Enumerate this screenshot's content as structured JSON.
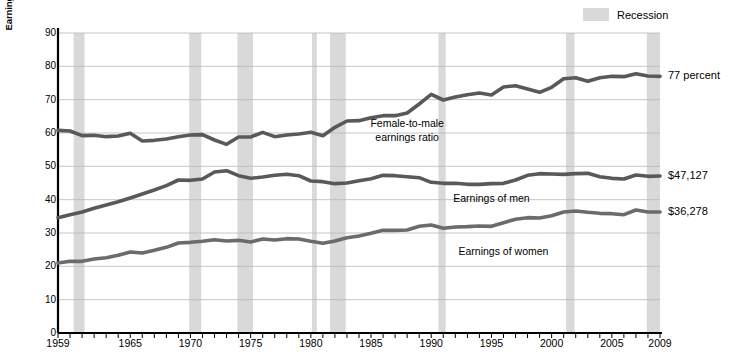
{
  "chart_data": {
    "type": "line",
    "title": "",
    "xlabel": "",
    "ylabel": "Earnings in thousands (2009 dollars), ratio in percent",
    "xlim": [
      1959,
      2009
    ],
    "ylim": [
      0,
      90
    ],
    "grid": true,
    "legend_position": "top-right",
    "x": [
      1959,
      1960,
      1961,
      1962,
      1963,
      1964,
      1965,
      1966,
      1967,
      1968,
      1969,
      1970,
      1971,
      1972,
      1973,
      1974,
      1975,
      1976,
      1977,
      1978,
      1979,
      1980,
      1981,
      1982,
      1983,
      1984,
      1985,
      1986,
      1987,
      1988,
      1989,
      1990,
      1991,
      1992,
      1993,
      1994,
      1995,
      1996,
      1997,
      1998,
      1999,
      2000,
      2001,
      2002,
      2003,
      2004,
      2005,
      2006,
      2007,
      2008,
      2009
    ],
    "series": [
      {
        "name": "Female-to-male earnings ratio",
        "unit": "percent",
        "color": "#595959",
        "values": [
          60.8,
          60.6,
          59.2,
          59.3,
          58.9,
          59.1,
          59.9,
          57.6,
          57.8,
          58.2,
          58.9,
          59.4,
          59.5,
          57.9,
          56.6,
          58.8,
          58.8,
          60.2,
          58.9,
          59.4,
          59.7,
          60.2,
          59.2,
          61.7,
          63.6,
          63.7,
          64.6,
          65.2,
          65.2,
          66.0,
          68.7,
          71.6,
          69.9,
          70.8,
          71.5,
          72.0,
          71.4,
          73.8,
          74.2,
          73.2,
          72.2,
          73.7,
          76.3,
          76.6,
          75.5,
          76.6,
          77.0,
          76.9,
          77.8,
          77.1,
          77.0
        ]
      },
      {
        "name": "Earnings of men",
        "unit": "thousands of 2009 dollars",
        "color": "#595959",
        "values": [
          34.6,
          35.5,
          36.3,
          37.4,
          38.4,
          39.4,
          40.5,
          41.7,
          42.9,
          44.2,
          45.9,
          45.8,
          46.2,
          48.3,
          48.7,
          47.2,
          46.4,
          46.8,
          47.3,
          47.6,
          47.2,
          45.6,
          45.4,
          44.8,
          45.0,
          45.7,
          46.3,
          47.3,
          47.2,
          46.9,
          46.6,
          45.2,
          44.9,
          44.9,
          44.6,
          44.6,
          44.8,
          44.9,
          45.9,
          47.3,
          47.8,
          47.7,
          47.6,
          47.8,
          47.9,
          46.9,
          46.4,
          46.2,
          47.4,
          47.0,
          47.1
        ]
      },
      {
        "name": "Earnings of women",
        "unit": "thousands of 2009 dollars",
        "color": "#6b6b6b",
        "values": [
          21.0,
          21.5,
          21.5,
          22.2,
          22.6,
          23.3,
          24.3,
          24.0,
          24.8,
          25.7,
          27.0,
          27.2,
          27.5,
          28.0,
          27.6,
          27.8,
          27.3,
          28.2,
          27.9,
          28.3,
          28.2,
          27.5,
          26.9,
          27.6,
          28.6,
          29.1,
          29.9,
          30.8,
          30.8,
          30.9,
          32.0,
          32.4,
          31.4,
          31.8,
          31.9,
          32.1,
          32.0,
          33.1,
          34.1,
          34.6,
          34.5,
          35.2,
          36.3,
          36.6,
          36.2,
          35.9,
          35.8,
          35.5,
          36.9,
          36.3,
          36.3
        ]
      }
    ],
    "recessions": [
      {
        "start": 1960.3,
        "end": 1961.2
      },
      {
        "start": 1969.9,
        "end": 1970.9
      },
      {
        "start": 1973.9,
        "end": 1975.2
      },
      {
        "start": 1980.1,
        "end": 1980.5
      },
      {
        "start": 1981.6,
        "end": 1982.9
      },
      {
        "start": 1990.6,
        "end": 1991.2
      },
      {
        "start": 2001.2,
        "end": 2001.9
      },
      {
        "start": 2007.9,
        "end": 2009.5
      }
    ],
    "yticks": [
      0,
      10,
      20,
      30,
      40,
      50,
      60,
      70,
      80,
      90
    ],
    "xticks": [
      1959,
      1965,
      1970,
      1975,
      1980,
      1985,
      1990,
      1995,
      2000,
      2005,
      2009
    ],
    "annotations": [
      {
        "name": "ratio-end-label",
        "text": "77 percent"
      },
      {
        "name": "men-end-label",
        "text": "$47,127"
      },
      {
        "name": "women-end-label",
        "text": "$36,278"
      },
      {
        "name": "ratio-inline-label",
        "text": "Female-to-male earnings ratio"
      },
      {
        "name": "men-inline-label",
        "text": "Earnings of men"
      },
      {
        "name": "women-inline-label",
        "text": "Earnings of women"
      }
    ],
    "legend": [
      {
        "label": "Recession",
        "color": "#d9d9d9"
      }
    ]
  },
  "axis": {
    "y_title": "Earnings in thousands (2009 dollars), ratio in percent",
    "y_ticks": [
      "0",
      "10",
      "20",
      "30",
      "40",
      "50",
      "60",
      "70",
      "80",
      "90"
    ],
    "x_ticks": [
      "1959",
      "1965",
      "1970",
      "1975",
      "1980",
      "1985",
      "1990",
      "1995",
      "2000",
      "2005",
      "2009"
    ]
  },
  "legend": {
    "recession_label": "Recession"
  },
  "annotations": {
    "ratio_end": "77 percent",
    "men_end": "$47,127",
    "women_end": "$36,278",
    "ratio_inline_line1": "Female-to-male",
    "ratio_inline_line2": "earnings ratio",
    "men_inline": "Earnings of men",
    "women_inline": "Earnings of women"
  },
  "colors": {
    "line": "#595959",
    "line_women": "#6b6b6b",
    "recession_band": "#d9d9d9",
    "gridline": "#b8b8b8",
    "axis": "#000000"
  }
}
